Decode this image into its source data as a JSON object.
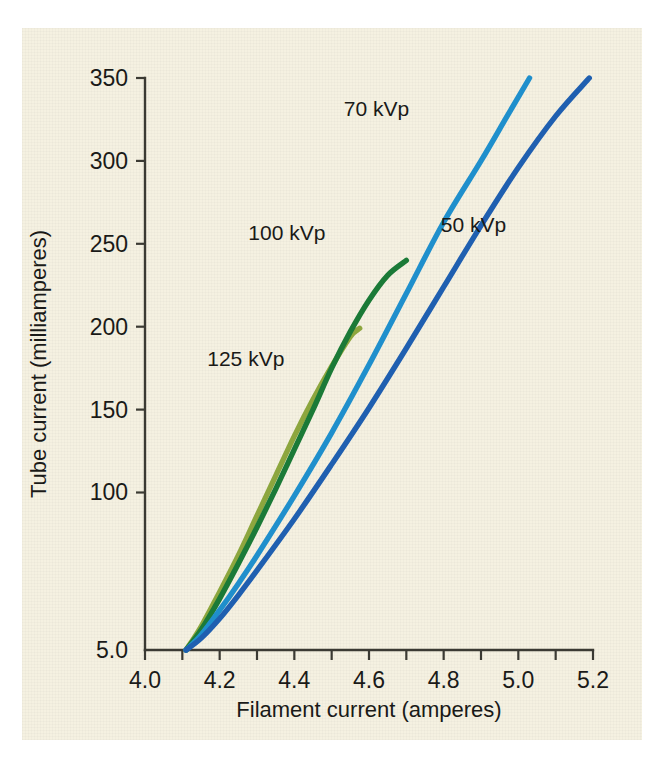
{
  "figure": {
    "background_color": "#f5f1e1",
    "page_color": "#ffffff"
  },
  "chart_data": {
    "type": "line",
    "title": "",
    "xlabel": "Filament current (amperes)",
    "ylabel": "Tube current (milliamperes)",
    "xlim": [
      4.0,
      5.2
    ],
    "ylim": [
      5,
      350
    ],
    "grid": false,
    "legend_position": "inline-annotations",
    "x_ticks_major": [
      4.0,
      4.2,
      4.4,
      4.6,
      4.8,
      5.0,
      5.2
    ],
    "x_tick_labels": [
      "4.0",
      "4.2",
      "4.4",
      "4.6",
      "4.8",
      "5.0",
      "5.2"
    ],
    "x_ticks_minor": [
      4.1,
      4.3,
      4.5,
      4.7,
      4.9,
      5.1
    ],
    "y_ticks_major": [
      5,
      100,
      150,
      200,
      250,
      300,
      350
    ],
    "y_tick_labels": [
      "5.0",
      "100",
      "150",
      "200",
      "250",
      "300",
      "350"
    ],
    "series": [
      {
        "name": "125 kVp",
        "color": "#8da63e",
        "label_x": 4.27,
        "label_y": 176,
        "points": [
          [
            4.11,
            5
          ],
          [
            4.15,
            19
          ],
          [
            4.2,
            40
          ],
          [
            4.25,
            62
          ],
          [
            4.3,
            86
          ],
          [
            4.35,
            110
          ],
          [
            4.4,
            134
          ],
          [
            4.45,
            156
          ],
          [
            4.5,
            176
          ],
          [
            4.55,
            194
          ],
          [
            4.575,
            199
          ]
        ]
      },
      {
        "name": "100 kVp",
        "color": "#1b7a37",
        "label_x": 4.38,
        "label_y": 252,
        "points": [
          [
            4.11,
            5
          ],
          [
            4.15,
            17
          ],
          [
            4.2,
            36
          ],
          [
            4.25,
            57
          ],
          [
            4.3,
            79
          ],
          [
            4.35,
            102
          ],
          [
            4.4,
            126
          ],
          [
            4.45,
            150
          ],
          [
            4.5,
            175
          ],
          [
            4.55,
            197
          ],
          [
            4.6,
            216
          ],
          [
            4.65,
            231
          ],
          [
            4.7,
            240
          ]
        ]
      },
      {
        "name": "70 kVp",
        "color": "#1f8fcc",
        "label_x": 4.62,
        "label_y": 327,
        "points": [
          [
            4.11,
            5
          ],
          [
            4.15,
            14
          ],
          [
            4.2,
            29
          ],
          [
            4.25,
            45
          ],
          [
            4.3,
            62
          ],
          [
            4.4,
            98
          ],
          [
            4.5,
            136
          ],
          [
            4.6,
            177
          ],
          [
            4.7,
            220
          ],
          [
            4.8,
            263
          ],
          [
            4.9,
            300
          ],
          [
            4.97,
            327
          ],
          [
            5.03,
            350
          ]
        ]
      },
      {
        "name": "50 kVp",
        "color": "#1f5fb0",
        "label_x": 4.88,
        "label_y": 257,
        "points": [
          [
            4.11,
            5
          ],
          [
            4.15,
            12
          ],
          [
            4.2,
            24
          ],
          [
            4.25,
            38
          ],
          [
            4.3,
            53
          ],
          [
            4.4,
            84
          ],
          [
            4.5,
            117
          ],
          [
            4.6,
            151
          ],
          [
            4.7,
            187
          ],
          [
            4.8,
            224
          ],
          [
            4.9,
            261
          ],
          [
            5.0,
            296
          ],
          [
            5.1,
            327
          ],
          [
            5.19,
            350
          ]
        ]
      }
    ]
  }
}
